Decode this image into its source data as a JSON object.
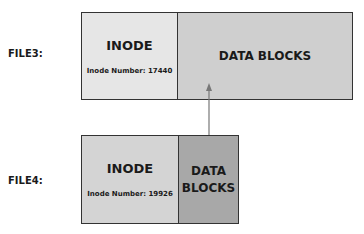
{
  "files": [
    {
      "label": "FILE3:",
      "inode": {
        "title": "INODE",
        "number_text": "Inode Number: 17440"
      },
      "data": {
        "title": "DATA BLOCKS"
      }
    },
    {
      "label": "FILE4:",
      "inode": {
        "title": "INODE",
        "number_text": "Inode Number: 19926"
      },
      "data": {
        "title_line1": "DATA",
        "title_line2": "BLOCKS"
      }
    }
  ],
  "colors": {
    "inode_fill": "#e6e6e6",
    "file3_data_fill": "#cfcfcf",
    "file4_inode_fill": "#d4d4d4",
    "file4_data_fill": "#a8a8a8",
    "arrow": "#777777"
  }
}
